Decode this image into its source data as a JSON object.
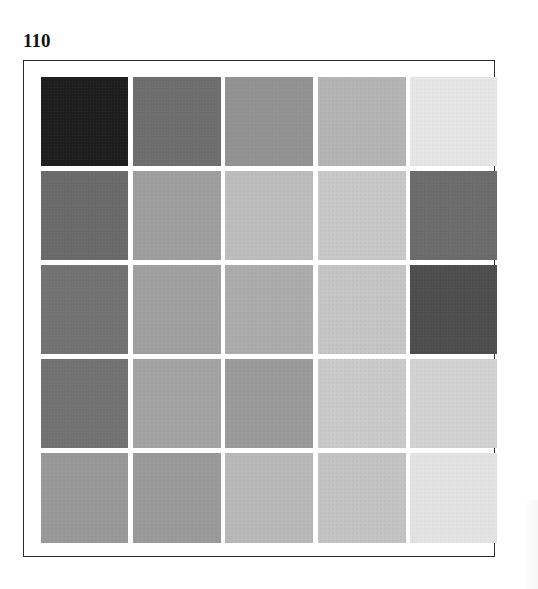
{
  "page": {
    "label": "110"
  },
  "swatch_grid": {
    "rows": 5,
    "columns": 5,
    "cells": [
      [
        "#1e1e1e",
        "#6e6e6e",
        "#929292",
        "#b4b4b4",
        "#e6e6e6"
      ],
      [
        "#6a6a6a",
        "#9e9e9e",
        "#bdbdbd",
        "#c8c8c8",
        "#6c6c6c"
      ],
      [
        "#737373",
        "#a0a0a0",
        "#ababab",
        "#c5c5c5",
        "#4e4e4e"
      ],
      [
        "#727272",
        "#a3a3a3",
        "#9a9a9a",
        "#cacaca",
        "#d2d2d2"
      ],
      [
        "#999999",
        "#9a9a9a",
        "#b8b8b8",
        "#c3c3c3",
        "#e3e3e3"
      ]
    ]
  },
  "colors": {
    "frame_border": "#2a2a2a",
    "background": "#ffffff",
    "label": "#111111"
  }
}
